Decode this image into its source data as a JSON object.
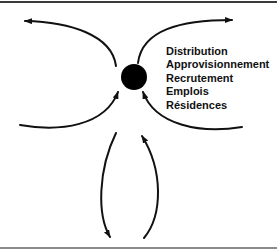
{
  "diagram": {
    "center_node": {
      "shape": "filled-circle",
      "color": "#000000"
    },
    "labels": [
      "Distribution",
      "Approvisionnement",
      "Recrutement",
      "Emplois",
      "Résidences"
    ],
    "arrows": [
      {
        "id": "top-left",
        "direction": "outward"
      },
      {
        "id": "top-right",
        "direction": "outward"
      },
      {
        "id": "lower-left",
        "direction": "inward"
      },
      {
        "id": "lower-right",
        "direction": "inward"
      },
      {
        "id": "bottom-left",
        "direction": "outward"
      },
      {
        "id": "bottom-right",
        "direction": "inward"
      }
    ]
  }
}
